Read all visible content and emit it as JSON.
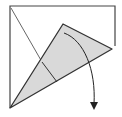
{
  "diagram": {
    "type": "origami-fold-step",
    "colors": {
      "paper": "#ffffff",
      "flap_fill": "#d9d9d9",
      "line": "#333333",
      "arrow": "#222222"
    },
    "elements": [
      {
        "name": "paper-square",
        "description": "square sheet outline"
      },
      {
        "name": "diagonal-crease",
        "description": "diagonal valley line from top-left corner"
      },
      {
        "name": "folded-flap",
        "description": "shaded triangular flap folded up from bottom-left corner"
      },
      {
        "name": "inner-crease",
        "description": "short crease line across the flap"
      },
      {
        "name": "unfold-arrow",
        "description": "curved arrow indicating flap folds back down"
      }
    ]
  }
}
